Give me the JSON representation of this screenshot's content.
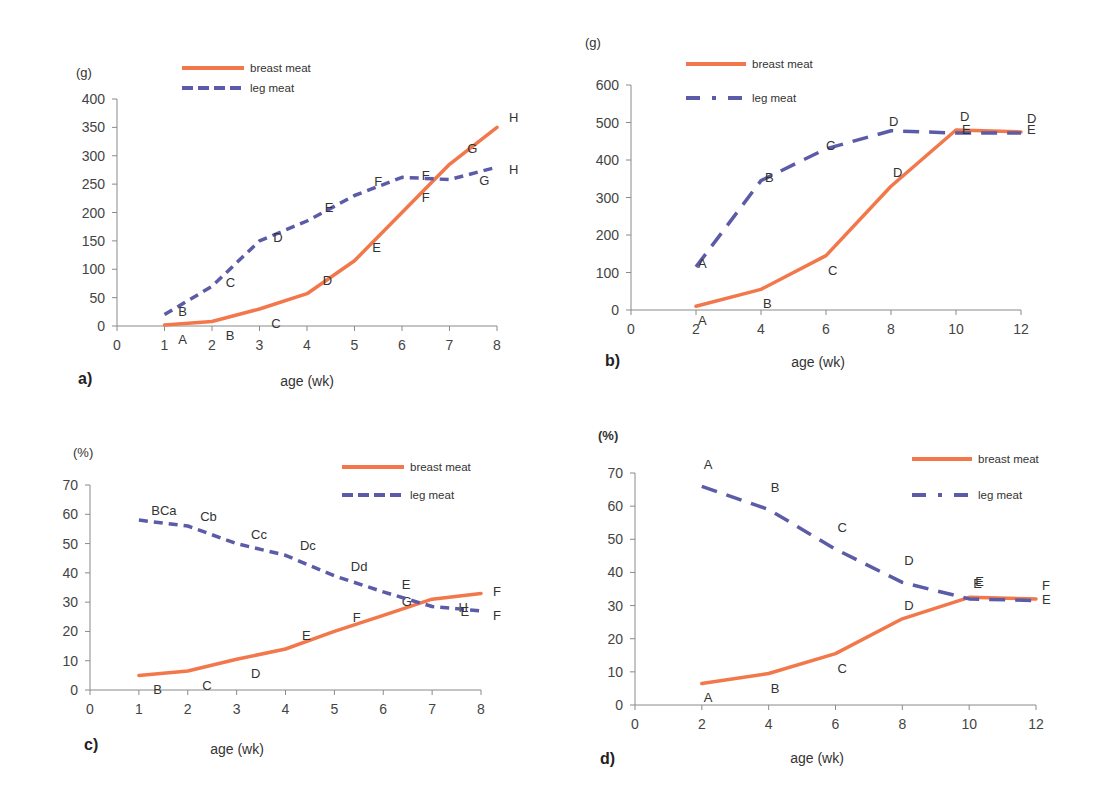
{
  "colors": {
    "breast": "#F2784B",
    "leg": "#5B5BA8"
  },
  "chart_data": [
    {
      "id": "a",
      "type": "line",
      "panel_label": "a)",
      "unit_label": "(g)",
      "xlabel": "age (wk)",
      "ylabel": "(g)",
      "xlim": [
        0,
        8
      ],
      "ylim": [
        0,
        400
      ],
      "xticks": [
        "0",
        "1",
        "2",
        "3",
        "4",
        "5",
        "6",
        "7",
        "8"
      ],
      "yticks": [
        "0",
        "50",
        "100",
        "150",
        "200",
        "250",
        "300",
        "350",
        "400"
      ],
      "xtick_values": [
        0,
        1,
        2,
        3,
        4,
        5,
        6,
        7,
        8
      ],
      "ytick_values": [
        0,
        50,
        100,
        150,
        200,
        250,
        300,
        350,
        400
      ],
      "grid": false,
      "legend": "top-center",
      "series": [
        {
          "name": "breast meat",
          "style": "solid",
          "x": [
            1,
            2,
            3,
            4,
            5,
            6,
            7,
            8
          ],
          "values": [
            2,
            8,
            30,
            57,
            115,
            200,
            285,
            350
          ],
          "letters": [
            "A",
            "B",
            "C",
            "D",
            "E",
            "F",
            "G",
            "H"
          ]
        },
        {
          "name": "leg meat",
          "style": "dashed",
          "x": [
            1,
            2,
            3,
            4,
            5,
            6,
            7,
            8
          ],
          "values": [
            20,
            70,
            150,
            185,
            230,
            262,
            258,
            280
          ],
          "letters": [
            "B",
            "C",
            "D",
            "E",
            "F",
            "F",
            "G",
            "H"
          ]
        }
      ]
    },
    {
      "id": "b",
      "type": "line",
      "panel_label": "b)",
      "unit_label": "(g)",
      "xlabel": "age (wk)",
      "ylabel": "(g)",
      "xlim": [
        0,
        12
      ],
      "ylim": [
        0,
        600
      ],
      "xticks": [
        "0",
        "2",
        "4",
        "6",
        "8",
        "10",
        "12"
      ],
      "yticks": [
        "0",
        "100",
        "200",
        "300",
        "400",
        "500",
        "600"
      ],
      "xtick_values": [
        0,
        2,
        4,
        6,
        8,
        10,
        12
      ],
      "ytick_values": [
        0,
        100,
        200,
        300,
        400,
        500,
        600
      ],
      "grid": false,
      "legend": "top-left",
      "series": [
        {
          "name": "breast meat",
          "style": "solid",
          "x": [
            2,
            4,
            6,
            8,
            10,
            12
          ],
          "values": [
            10,
            55,
            145,
            330,
            480,
            475
          ],
          "letters": [
            "A",
            "B",
            "C",
            "D",
            "D",
            "D"
          ]
        },
        {
          "name": "leg meat",
          "style": "dash-dot",
          "x": [
            2,
            4,
            6,
            8,
            10,
            12
          ],
          "values": [
            115,
            345,
            430,
            478,
            472,
            472
          ],
          "letters": [
            "A",
            "B",
            "C",
            "D",
            "E",
            "E"
          ]
        }
      ]
    },
    {
      "id": "c",
      "type": "line",
      "panel_label": "c)",
      "unit_label": "(%)",
      "xlabel": "age (wk)",
      "ylabel": "(%)",
      "xlim": [
        0,
        8
      ],
      "ylim": [
        0,
        70
      ],
      "xticks": [
        "0",
        "1",
        "2",
        "3",
        "4",
        "5",
        "6",
        "7",
        "8"
      ],
      "yticks": [
        "0",
        "10",
        "20",
        "30",
        "40",
        "50",
        "60",
        "70"
      ],
      "xtick_values": [
        0,
        1,
        2,
        3,
        4,
        5,
        6,
        7,
        8
      ],
      "ytick_values": [
        0,
        10,
        20,
        30,
        40,
        50,
        60,
        70
      ],
      "grid": false,
      "legend": "top-right",
      "series": [
        {
          "name": "breast meat",
          "style": "solid",
          "x": [
            1,
            2,
            3,
            4,
            5,
            6,
            7,
            8
          ],
          "values": [
            5,
            6.5,
            10.5,
            14,
            20,
            25.5,
            31,
            33
          ],
          "letters": [
            "B",
            "C",
            "D",
            "E",
            "F",
            "G",
            "H",
            "F"
          ]
        },
        {
          "name": "leg meat",
          "style": "dashed",
          "x": [
            1,
            2,
            3,
            4,
            5,
            6,
            7,
            8
          ],
          "values": [
            58,
            56,
            50,
            46,
            39,
            33.5,
            28.5,
            27
          ],
          "letters": [
            "BCa",
            "Cb",
            "Cc",
            "Dc",
            "Dd",
            "E",
            "E",
            "F"
          ]
        }
      ]
    },
    {
      "id": "d",
      "type": "line",
      "panel_label": "d)",
      "unit_label": "(%)",
      "xlabel": "age (wk)",
      "ylabel": "(%)",
      "xlim": [
        0,
        12
      ],
      "ylim": [
        0,
        70
      ],
      "xticks": [
        "0",
        "2",
        "4",
        "6",
        "8",
        "10",
        "12"
      ],
      "yticks": [
        "0",
        "10",
        "20",
        "30",
        "40",
        "50",
        "60",
        "70"
      ],
      "xtick_values": [
        0,
        2,
        4,
        6,
        8,
        10,
        12
      ],
      "ytick_values": [
        0,
        10,
        20,
        30,
        40,
        50,
        60,
        70
      ],
      "grid": false,
      "legend": "top-right",
      "series": [
        {
          "name": "breast meat",
          "style": "solid",
          "x": [
            2,
            4,
            6,
            8,
            10,
            12
          ],
          "values": [
            6.5,
            9.5,
            15.5,
            26,
            32.5,
            32
          ],
          "letters": [
            "A",
            "B",
            "C",
            "D",
            "E",
            "F"
          ]
        },
        {
          "name": "leg meat",
          "style": "dash-dot",
          "x": [
            2,
            4,
            6,
            8,
            10,
            12
          ],
          "values": [
            66,
            59,
            47,
            37,
            32,
            31.5
          ],
          "letters": [
            "A",
            "B",
            "C",
            "D",
            "E",
            "E"
          ]
        }
      ]
    }
  ]
}
